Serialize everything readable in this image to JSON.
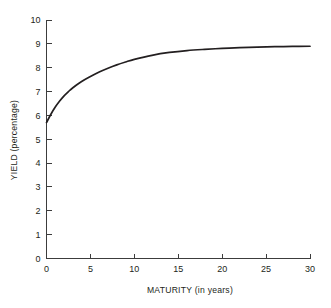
{
  "chart_data": {
    "type": "line",
    "title": "",
    "subtitle": "",
    "xlabel": "MATURITY (in years)",
    "ylabel": "YIELD (percentage)",
    "xlim": [
      0,
      30
    ],
    "ylim": [
      0,
      10
    ],
    "xticks": [
      "0",
      "5",
      "10",
      "15",
      "20",
      "25",
      "30"
    ],
    "xtick_values": [
      0,
      5,
      10,
      15,
      20,
      25,
      30
    ],
    "yticks": [
      "0",
      "1",
      "2",
      "3",
      "4",
      "5",
      "6",
      "7",
      "8",
      "9",
      "10"
    ],
    "ytick_values": [
      0,
      1,
      2,
      3,
      4,
      5,
      6,
      7,
      8,
      9,
      10
    ],
    "grid": false,
    "legend": null,
    "legend_position": "none",
    "annotations": [],
    "series": [
      {
        "name": "Yield curve",
        "color": "#231f20",
        "x": [
          0,
          0.5,
          1,
          1.5,
          2,
          2.5,
          3,
          4,
          5,
          6,
          7,
          8,
          9,
          10,
          12,
          14,
          16,
          18,
          20,
          22,
          24,
          26,
          28,
          30
        ],
        "values": [
          5.7,
          6.05,
          6.35,
          6.6,
          6.82,
          7.0,
          7.16,
          7.42,
          7.63,
          7.82,
          7.98,
          8.12,
          8.24,
          8.35,
          8.52,
          8.64,
          8.72,
          8.77,
          8.81,
          8.84,
          8.86,
          8.88,
          8.89,
          8.9
        ]
      }
    ]
  },
  "axes": {
    "y_axis_name": "y-axis",
    "x_axis_name": "x-axis"
  }
}
